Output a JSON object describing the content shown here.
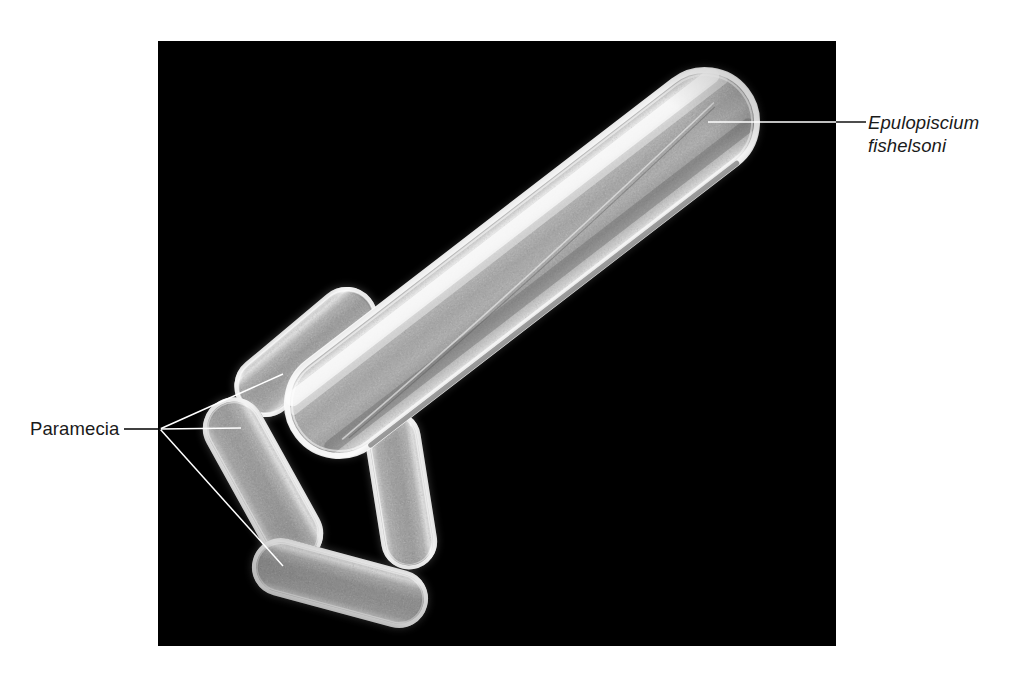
{
  "figure": {
    "background_color": "#ffffff",
    "panel": {
      "name": "sem-micrograph",
      "background_color": "#000000",
      "x": 158,
      "y": 41,
      "width": 678,
      "height": 605
    }
  },
  "labels": {
    "paramecia": {
      "text": "Paramecia",
      "style": "normal",
      "color": "#1a1a1a",
      "x": 30,
      "y": 417
    },
    "epulopiscium": {
      "line1": "Epulopiscium",
      "line2": "fishelsoni",
      "style": "italic",
      "color": "#1a1a1a",
      "x": 868,
      "y": 111
    }
  },
  "leaders": {
    "line_color": "#000000",
    "panel_line_color": "#ffffff",
    "paramecia": {
      "hub_x": 160,
      "hub_y": 429,
      "stem_from_x": 124,
      "stem_to_x": 160,
      "targets": [
        {
          "name": "paramecium-top",
          "x": 283,
          "y": 374
        },
        {
          "name": "paramecium-left",
          "x": 241,
          "y": 428
        },
        {
          "name": "paramecium-bottom",
          "x": 283,
          "y": 566
        }
      ]
    },
    "epulopiscium": {
      "from_x": 708,
      "from_y": 122,
      "to_x": 866,
      "to_y": 122
    }
  },
  "specimens": {
    "epulopiscium": {
      "name": "epulopiscium-cell",
      "common_label": "Epulopiscium fishelsoni",
      "center_x": 522,
      "center_y": 263,
      "length": 570,
      "width": 108,
      "angle_deg": -37.6
    },
    "paramecia": [
      {
        "name": "paramecium-top",
        "center_x": 306,
        "center_y": 352,
        "length": 168,
        "width": 62,
        "angle_deg": -40
      },
      {
        "name": "paramecium-left",
        "center_x": 263,
        "center_y": 481,
        "length": 182,
        "width": 62,
        "angle_deg": 61
      },
      {
        "name": "paramecium-right",
        "center_x": 401,
        "center_y": 490,
        "length": 160,
        "width": 56,
        "angle_deg": 81
      },
      {
        "name": "paramecium-bottom",
        "center_x": 340,
        "center_y": 583,
        "length": 180,
        "width": 58,
        "angle_deg": 15
      }
    ]
  }
}
